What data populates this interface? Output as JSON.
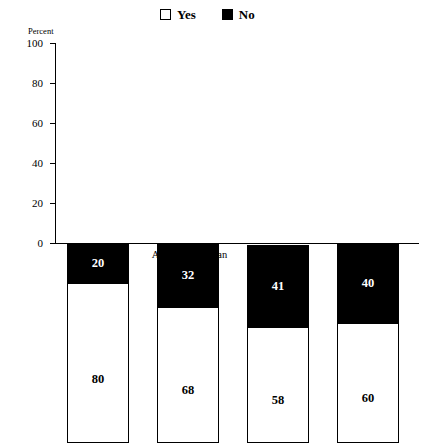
{
  "legend": {
    "items": [
      {
        "label": "Yes",
        "swatch": "white-square-swatch"
      },
      {
        "label": "No",
        "swatch": "black-square-swatch"
      }
    ]
  },
  "axis": {
    "y_title": "Percent",
    "y_ticks": [
      "100",
      "80",
      "60",
      "40",
      "20",
      "0"
    ]
  },
  "chart_data": {
    "type": "bar",
    "stacked": true,
    "title": "",
    "xlabel": "",
    "ylabel": "Percent",
    "ylim": [
      0,
      100
    ],
    "yticks": [
      0,
      20,
      40,
      60,
      80,
      100
    ],
    "grid": false,
    "legend_position": "top-center",
    "categories": [
      "White",
      "African American",
      "Hispanic",
      "Asian"
    ],
    "series": [
      {
        "name": "Yes",
        "color": "#ffffff",
        "values": [
          80,
          68,
          58,
          60
        ]
      },
      {
        "name": "No",
        "color": "#000000",
        "values": [
          20,
          32,
          41,
          40
        ]
      }
    ]
  }
}
